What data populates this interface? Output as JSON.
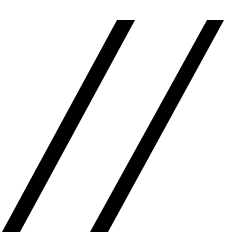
{
  "figure": {
    "glyph": "//",
    "background_color": "#ffffff",
    "stroke_color": "#000000",
    "slashes": [
      {
        "name": "left-slash",
        "points": "117,20 135,20 20,232 2,232"
      },
      {
        "name": "right-slash",
        "points": "207,20 224,20 108,232 90,232"
      }
    ]
  }
}
